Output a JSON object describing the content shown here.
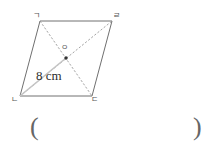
{
  "figure": {
    "type": "parallelogram-with-diagonals",
    "vertices": {
      "top_left": "ㄱ",
      "top_right": "ㄹ",
      "bottom_left": "ㄴ",
      "bottom_right": "ㄷ",
      "center": "ㅇ"
    },
    "measurement_label": "8 cm",
    "geometry": {
      "top_left_xy": [
        40,
        21
      ],
      "top_right_xy": [
        112,
        21
      ],
      "bottom_right_xy": [
        92,
        96
      ],
      "bottom_left_xy": [
        20,
        96
      ],
      "center_xy": [
        66,
        58
      ]
    },
    "colors": {
      "outline": "#707070",
      "diagonal": "#9a9a9a",
      "measure_segment": "#bbbbbb",
      "center_dot": "#333333",
      "label_text": "#555555",
      "measure_text": "#2b2b2b",
      "background": "#ffffff"
    }
  },
  "answer": {
    "paren_open": "(",
    "paren_close": ")",
    "value": ""
  }
}
